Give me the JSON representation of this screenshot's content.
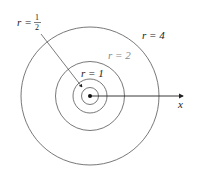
{
  "diagram": {
    "center": {
      "x": 90,
      "y": 96
    },
    "scale_px_per_unit": 17.2,
    "circles": [
      {
        "r": 0.5,
        "label": "r = 1/2",
        "color": "#555555"
      },
      {
        "r": 1,
        "label": "r = 1",
        "color": "#555555"
      },
      {
        "r": 2,
        "label": "r = 2",
        "color": "#555555"
      },
      {
        "r": 4,
        "label": "r = 4",
        "color": "#555555"
      }
    ],
    "axis": {
      "label": "x"
    },
    "labels": {
      "r_half_var": "r",
      "r_half_eq": "=",
      "r_half_num": "1",
      "r_half_den": "2",
      "r1": "r = 1",
      "r2": "r = 2",
      "r4": "r = 4"
    }
  }
}
